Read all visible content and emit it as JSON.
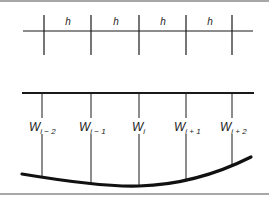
{
  "diagram": {
    "grid": {
      "spacing_label": "h",
      "spacing_labels": [
        "h",
        "h",
        "h",
        "h"
      ]
    },
    "deflection": {
      "labels": [
        {
          "base": "W",
          "sub": "i − 2"
        },
        {
          "base": "W",
          "sub": "i − 1"
        },
        {
          "base": "W",
          "sub": "i"
        },
        {
          "base": "W",
          "sub": "i + 1"
        },
        {
          "base": "W",
          "sub": "i + 2"
        }
      ]
    },
    "colors": {
      "line": "#1a1a1a",
      "border": "#7a7a7a"
    }
  }
}
